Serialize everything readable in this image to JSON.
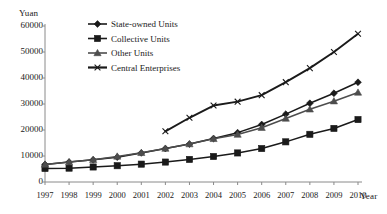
{
  "chart_data": {
    "type": "line",
    "title": "",
    "subtitle": "",
    "xlabel": "Year",
    "ylabel": "Yuan",
    "grid": false,
    "legend_position": "top-center",
    "categories": [
      "1997",
      "1998",
      "1999",
      "2000",
      "2001",
      "2002",
      "2003",
      "2004",
      "2005",
      "2006",
      "2007",
      "2008",
      "2009",
      "2010"
    ],
    "x": [
      1997,
      1998,
      1999,
      2000,
      2001,
      2002,
      2003,
      2004,
      2005,
      2006,
      2007,
      2008,
      2009,
      2010
    ],
    "xlim": [
      1997,
      2010
    ],
    "ylim": [
      0,
      60000
    ],
    "yticks": [
      0,
      10000,
      20000,
      30000,
      40000,
      50000,
      60000
    ],
    "ytick_labels": [
      "0",
      "10000",
      "20000",
      "30000",
      "40000",
      "50000",
      "60000"
    ],
    "series": [
      {
        "name": "State-owned Units",
        "marker": "diamond",
        "color": "#1a1a1a",
        "values": [
          6747,
          7668,
          8543,
          9552,
          11178,
          12869,
          14577,
          16729,
          18978,
          22112,
          26100,
          30287,
          34130,
          38359
        ]
      },
      {
        "name": "Collective Units",
        "marker": "square",
        "color": "#1a1a1a",
        "values": [
          5199,
          5331,
          5774,
          6262,
          6867,
          7667,
          8678,
          9814,
          11176,
          12866,
          15444,
          18338,
          20607,
          24010
        ]
      },
      {
        "name": "Other Units",
        "marker": "triangle",
        "color": "#4d4d4d",
        "values": [
          6747,
          7654,
          8567,
          9829,
          11213,
          12869,
          14574,
          16595,
          18244,
          20883,
          24426,
          27958,
          31078,
          34424
        ]
      },
      {
        "name": "Central Enterprises",
        "marker": "cross",
        "color": "#1a1a1a",
        "values": [
          null,
          null,
          null,
          null,
          null,
          19500,
          24700,
          29400,
          30900,
          33400,
          38400,
          43800,
          50000,
          57000
        ]
      }
    ]
  },
  "axis": {
    "y_unit": "Yuan",
    "x_unit": "Year"
  },
  "legend": {
    "items": [
      {
        "label": "State-owned Units",
        "marker": "diamond-marker-icon"
      },
      {
        "label": "Collective Units",
        "marker": "square-marker-icon"
      },
      {
        "label": "Other Units",
        "marker": "triangle-marker-icon"
      },
      {
        "label": "Central Enterprises",
        "marker": "cross-marker-icon"
      }
    ]
  }
}
